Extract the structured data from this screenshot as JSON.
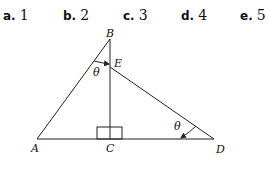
{
  "choices": [
    {
      "letter": "a.",
      "value": "1"
    },
    {
      "letter": "b.",
      "value": "2"
    },
    {
      "letter": "c.",
      "value": "3"
    },
    {
      "letter": "d.",
      "value": "4"
    },
    {
      "letter": "e.",
      "value": "5"
    }
  ],
  "diagram": {
    "points": {
      "A": {
        "label": "A",
        "x": 37,
        "y": 139
      },
      "B": {
        "label": "B",
        "x": 110,
        "y": 39
      },
      "C": {
        "label": "C",
        "x": 110,
        "y": 139
      },
      "D": {
        "label": "D",
        "x": 214,
        "y": 139
      },
      "E": {
        "label": "E",
        "x": 110,
        "y": 67
      }
    },
    "angle_label_B": "θ",
    "angle_label_D": "θ",
    "line_color": "#222222"
  }
}
